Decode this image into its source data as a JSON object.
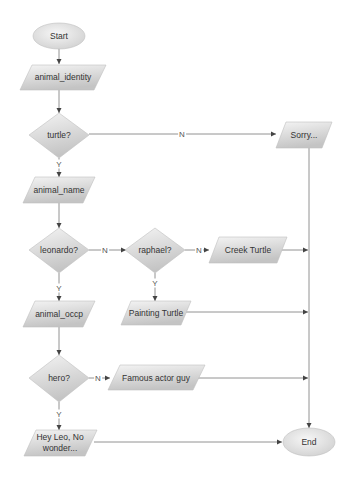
{
  "diagram": {
    "type": "flowchart",
    "colors": {
      "node_fill_light": "#f2f2f2",
      "node_fill_dark": "#c8c8c8",
      "stroke": "#888888",
      "edge": "#707070",
      "text": "#333333"
    },
    "nodes": [
      {
        "id": "start",
        "shape": "ellipse",
        "label": "Start"
      },
      {
        "id": "animal_identity",
        "shape": "parallelogram",
        "label": "animal_identity"
      },
      {
        "id": "turtle",
        "shape": "diamond",
        "label": "turtle?"
      },
      {
        "id": "sorry",
        "shape": "parallelogram",
        "label": "Sorry..."
      },
      {
        "id": "animal_name",
        "shape": "parallelogram",
        "label": "animal_name"
      },
      {
        "id": "leonardo",
        "shape": "diamond",
        "label": "leonardo?"
      },
      {
        "id": "raphael",
        "shape": "diamond",
        "label": "raphael?"
      },
      {
        "id": "creek",
        "shape": "parallelogram",
        "label": "Creek Turtle"
      },
      {
        "id": "painting",
        "shape": "parallelogram",
        "label": "Painting Turtle"
      },
      {
        "id": "animal_occp",
        "shape": "parallelogram",
        "label": "animal_occp"
      },
      {
        "id": "hero",
        "shape": "diamond",
        "label": "hero?"
      },
      {
        "id": "famous",
        "shape": "parallelogram",
        "label": "Famous actor guy"
      },
      {
        "id": "heyleo",
        "shape": "parallelogram",
        "label_line1": "Hey Leo, No",
        "label_line2": "wonder..."
      },
      {
        "id": "end",
        "shape": "ellipse",
        "label": "End"
      }
    ],
    "edges": [
      {
        "from": "start",
        "to": "animal_identity",
        "label": ""
      },
      {
        "from": "animal_identity",
        "to": "turtle",
        "label": ""
      },
      {
        "from": "turtle",
        "to": "sorry",
        "label": "N"
      },
      {
        "from": "turtle",
        "to": "animal_name",
        "label": "Y"
      },
      {
        "from": "animal_name",
        "to": "leonardo",
        "label": ""
      },
      {
        "from": "leonardo",
        "to": "raphael",
        "label": "N"
      },
      {
        "from": "leonardo",
        "to": "animal_occp",
        "label": "Y"
      },
      {
        "from": "raphael",
        "to": "creek",
        "label": "N"
      },
      {
        "from": "raphael",
        "to": "painting",
        "label": "Y"
      },
      {
        "from": "creek",
        "to": "end",
        "label": ""
      },
      {
        "from": "painting",
        "to": "end",
        "label": ""
      },
      {
        "from": "sorry",
        "to": "end",
        "label": ""
      },
      {
        "from": "animal_occp",
        "to": "hero",
        "label": ""
      },
      {
        "from": "hero",
        "to": "famous",
        "label": "N"
      },
      {
        "from": "hero",
        "to": "heyleo",
        "label": "Y"
      },
      {
        "from": "famous",
        "to": "end",
        "label": ""
      },
      {
        "from": "heyleo",
        "to": "end",
        "label": ""
      }
    ],
    "edge_labels": {
      "turtle_n": "N",
      "turtle_y": "Y",
      "leonardo_n": "N",
      "leonardo_y": "Y",
      "raphael_n": "N",
      "raphael_y": "Y",
      "hero_n": "N",
      "hero_y": "Y"
    }
  }
}
